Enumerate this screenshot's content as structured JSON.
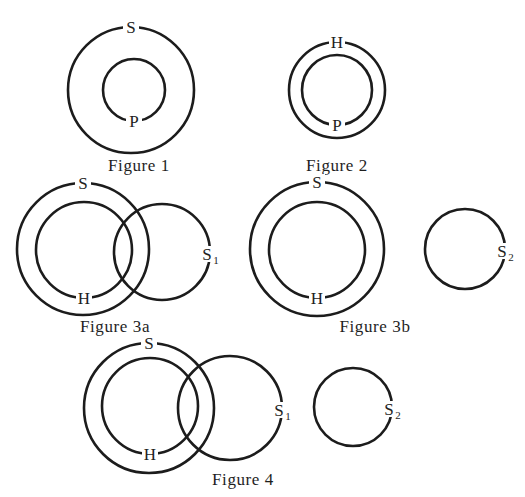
{
  "figures": [
    {
      "id": "figure-1",
      "caption": "Figure 1",
      "caption_pos": [
        139,
        171
      ],
      "circles": [
        {
          "label": "S",
          "sub": "",
          "cx": 131,
          "cy": 90,
          "r": 63,
          "label_at": "top"
        },
        {
          "label": "P",
          "sub": "",
          "cx": 134,
          "cy": 90,
          "r": 31,
          "label_at": "bottom"
        }
      ]
    },
    {
      "id": "figure-2",
      "caption": "Figure 2",
      "caption_pos": [
        337,
        171
      ],
      "circles": [
        {
          "label": "H",
          "sub": "",
          "cx": 337,
          "cy": 90,
          "r": 48,
          "label_at": "top"
        },
        {
          "label": "P",
          "sub": "",
          "cx": 337,
          "cy": 90,
          "r": 35,
          "label_at": "bottom"
        }
      ]
    },
    {
      "id": "figure-3a",
      "caption": "Figure 3a",
      "caption_pos": [
        115,
        332
      ],
      "circles": [
        {
          "label": "S",
          "sub": "",
          "cx": 83,
          "cy": 249,
          "r": 66,
          "label_at": "top"
        },
        {
          "label": "H",
          "sub": "",
          "cx": 84,
          "cy": 250,
          "r": 48,
          "label_at": "bottom"
        },
        {
          "label": "S",
          "sub": "1",
          "cx": 162,
          "cy": 252,
          "r": 48,
          "label_at": "right"
        }
      ]
    },
    {
      "id": "figure-3b",
      "caption": "Figure 3b",
      "caption_pos": [
        375,
        332
      ],
      "circles": [
        {
          "label": "S",
          "sub": "",
          "cx": 317,
          "cy": 249,
          "r": 67,
          "label_at": "top"
        },
        {
          "label": "H",
          "sub": "",
          "cx": 317,
          "cy": 250,
          "r": 48,
          "label_at": "bottom"
        },
        {
          "label": "S",
          "sub": "2",
          "cx": 465,
          "cy": 249,
          "r": 40,
          "label_at": "right"
        }
      ]
    },
    {
      "id": "figure-4",
      "caption": "Figure 4",
      "caption_pos": [
        243,
        485
      ],
      "circles": [
        {
          "label": "S",
          "sub": "",
          "cx": 149,
          "cy": 408,
          "r": 65,
          "label_at": "top"
        },
        {
          "label": "H",
          "sub": "",
          "cx": 150,
          "cy": 406,
          "r": 48,
          "label_at": "bottom"
        },
        {
          "label": "S",
          "sub": "1",
          "cx": 230,
          "cy": 408,
          "r": 52,
          "label_at": "right"
        },
        {
          "label": "S",
          "sub": "2",
          "cx": 353,
          "cy": 407,
          "r": 39,
          "label_at": "right"
        }
      ]
    }
  ],
  "colors": {
    "stroke": "#1c1c1c",
    "text": "#1e1e1e",
    "background": "#ffffff"
  }
}
